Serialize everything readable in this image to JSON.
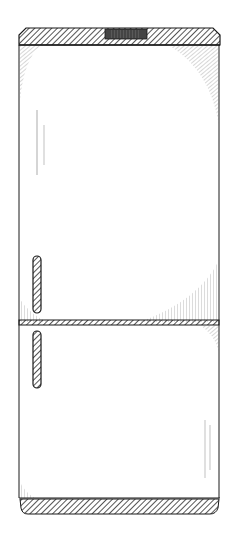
{
  "illustration": {
    "subject": "two-door refrigerator",
    "style": "pen-and-ink hatched sketch",
    "colors": {
      "background": "#ffffff",
      "ink": "#1a1a1a",
      "hatch": "#3a3a3a",
      "shade": "#555555"
    },
    "parts": [
      "top-cap",
      "top-cap-vent",
      "upper-door",
      "upper-door-handle",
      "door-divider",
      "lower-door",
      "lower-door-handle",
      "base-plinth"
    ]
  }
}
